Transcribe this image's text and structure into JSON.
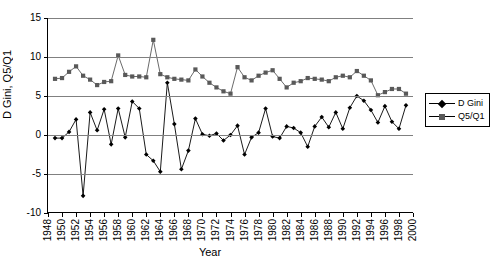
{
  "chart_data": {
    "type": "line",
    "title": "",
    "xlabel": "Year",
    "ylabel": "D Gini, Q5/Q1",
    "xlim": [
      1948,
      2000
    ],
    "ylim": [
      -10,
      15
    ],
    "yticks": [
      15,
      10,
      5,
      0,
      -5,
      -10
    ],
    "xticks": [
      1948,
      1950,
      1952,
      1954,
      1956,
      1958,
      1960,
      1962,
      1964,
      1966,
      1968,
      1970,
      1972,
      1974,
      1976,
      1978,
      1980,
      1982,
      1984,
      1986,
      1988,
      1990,
      1992,
      1994,
      1996,
      1998,
      2000
    ],
    "grid": "horizontal",
    "legend_position": "right",
    "x": [
      1949,
      1950,
      1951,
      1952,
      1953,
      1954,
      1955,
      1956,
      1957,
      1958,
      1959,
      1960,
      1961,
      1962,
      1963,
      1964,
      1965,
      1966,
      1967,
      1968,
      1969,
      1970,
      1971,
      1972,
      1973,
      1974,
      1975,
      1976,
      1977,
      1978,
      1979,
      1980,
      1981,
      1982,
      1983,
      1984,
      1985,
      1986,
      1987,
      1988,
      1989,
      1990,
      1991,
      1992,
      1993,
      1994,
      1995,
      1996,
      1997,
      1998,
      1999
    ],
    "series": [
      {
        "name": "D Gini",
        "marker": "diamond",
        "color": "#000000",
        "values": [
          -0.4,
          -0.4,
          0.4,
          2.0,
          -7.8,
          2.9,
          0.6,
          3.3,
          -1.2,
          3.4,
          -0.3,
          4.3,
          3.4,
          -2.5,
          -3.3,
          -4.7,
          6.7,
          1.4,
          -4.4,
          -2.0,
          2.1,
          0.1,
          -0.1,
          0.2,
          -0.7,
          0.0,
          1.2,
          -2.5,
          -0.3,
          0.3,
          3.4,
          -0.2,
          -0.4,
          1.1,
          0.9,
          0.3,
          -1.5,
          1.1,
          2.3,
          1.0,
          2.9,
          0.8,
          3.5,
          5.0,
          4.4,
          3.2,
          1.6,
          3.7,
          1.7,
          0.8,
          3.8
        ]
      },
      {
        "name": "Q5/Q1",
        "marker": "square",
        "color": "#595959",
        "values": [
          7.2,
          7.3,
          8.1,
          8.8,
          7.6,
          7.1,
          6.4,
          6.8,
          6.9,
          10.2,
          7.7,
          7.5,
          7.5,
          7.4,
          12.2,
          7.8,
          7.4,
          7.2,
          7.1,
          7.0,
          8.4,
          7.5,
          6.7,
          6.1,
          5.6,
          5.3,
          8.7,
          7.4,
          7.0,
          7.6,
          8.0,
          8.3,
          7.2,
          6.1,
          6.7,
          6.9,
          7.3,
          7.2,
          7.1,
          6.9,
          7.4,
          7.6,
          7.4,
          8.2,
          7.6,
          7.0,
          5.1,
          5.5,
          5.9,
          5.9,
          5.3
        ]
      }
    ]
  }
}
